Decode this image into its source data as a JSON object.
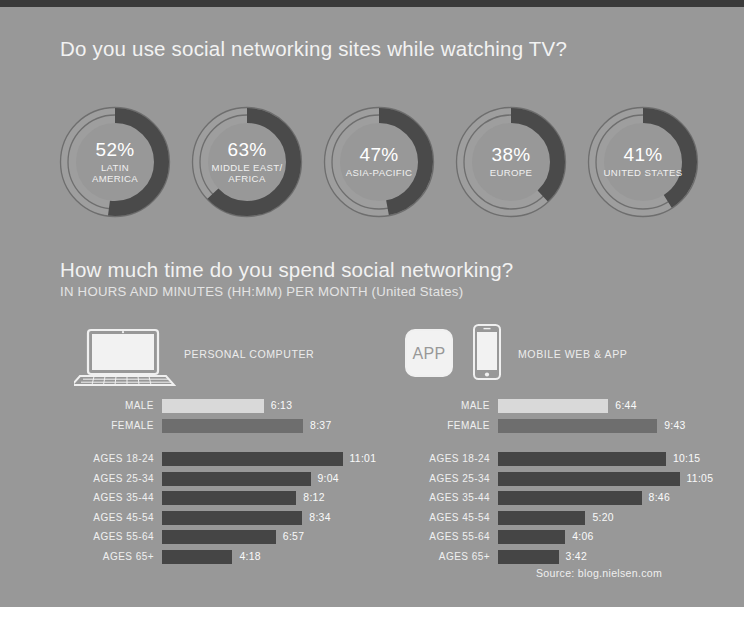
{
  "colors": {
    "background": "#989898",
    "top_band": "#3a3a3a",
    "bottom_band": "#ffffff",
    "donut_track": "#9e9e9e",
    "donut_value": "#4a4a4a",
    "donut_outline": "#6e6e6e",
    "bar_light": "#d9d9d9",
    "bar_medium": "#6e6e6e",
    "bar_dark": "#454545",
    "heading_text": "#f2f2f2"
  },
  "headings": {
    "question1": "Do you use social networking sites while watching TV?",
    "question2": "How much time do you spend social networking?",
    "subtitle2": "IN HOURS AND MINUTES (HH:MM) PER MONTH (United States)"
  },
  "source": "Source: blog.nielsen.com",
  "chart_data": [
    {
      "type": "pie",
      "title": "Do you use social networking sites while watching TV?",
      "unit": "percent",
      "categories": [
        "LATIN\nAMERICA",
        "MIDDLE EAST/\nAFRICA",
        "ASIA-PACIFIC",
        "EUROPE",
        "UNITED STATES"
      ],
      "values": [
        52,
        63,
        47,
        38,
        41
      ],
      "labels": [
        "52%",
        "63%",
        "47%",
        "38%",
        "41%"
      ],
      "legend": "none"
    },
    {
      "type": "bar",
      "orientation": "horizontal",
      "title": "PERSONAL COMPUTER",
      "xlabel": "HOURS:MINUTES PER MONTH",
      "ylabel": "",
      "xlim": [
        0,
        11.6
      ],
      "grid": false,
      "legend": "none",
      "groups": [
        {
          "name": "gender",
          "categories": [
            "MALE",
            "FEMALE"
          ],
          "labels": [
            "6:13",
            "8:37"
          ],
          "values": [
            6.217,
            8.617
          ]
        },
        {
          "name": "age",
          "categories": [
            "AGES 18-24",
            "AGES 25-34",
            "AGES 35-44",
            "AGES 45-54",
            "AGES 55-64",
            "AGES 65+"
          ],
          "labels": [
            "11:01",
            "9:04",
            "8:12",
            "8:34",
            "6:57",
            "4:18"
          ],
          "values": [
            11.017,
            9.067,
            8.2,
            8.567,
            6.95,
            4.3
          ]
        }
      ]
    },
    {
      "type": "bar",
      "orientation": "horizontal",
      "title": "MOBILE WEB & APP",
      "xlabel": "HOURS:MINUTES PER MONTH",
      "ylabel": "",
      "xlim": [
        0,
        11.6
      ],
      "grid": false,
      "legend": "none",
      "groups": [
        {
          "name": "gender",
          "categories": [
            "MALE",
            "FEMALE"
          ],
          "labels": [
            "6:44",
            "9:43"
          ],
          "values": [
            6.733,
            9.717
          ]
        },
        {
          "name": "age",
          "categories": [
            "AGES 18-24",
            "AGES 25-34",
            "AGES 35-44",
            "AGES 45-54",
            "AGES 55-64",
            "AGES 65+"
          ],
          "labels": [
            "10:15",
            "11:05",
            "8:46",
            "5:20",
            "4:06",
            "3:42"
          ],
          "values": [
            10.25,
            11.083,
            8.767,
            5.333,
            4.1,
            3.7
          ]
        }
      ]
    }
  ],
  "donuts": [
    {
      "pct": "52%",
      "region": "LATIN\nAMERICA",
      "value": 52
    },
    {
      "pct": "63%",
      "region": "MIDDLE EAST/\nAFRICA",
      "value": 63
    },
    {
      "pct": "47%",
      "region": "ASIA-PACIFIC",
      "value": 47
    },
    {
      "pct": "38%",
      "region": "EUROPE",
      "value": 38
    },
    {
      "pct": "41%",
      "region": "UNITED STATES",
      "value": 41
    }
  ],
  "panels": [
    {
      "id": "pc",
      "icon_label": "PERSONAL COMPUTER",
      "icons": [
        "laptop-icon"
      ],
      "gender": [
        {
          "label": "MALE",
          "value": "6:13",
          "num": 6.217,
          "tone": "light"
        },
        {
          "label": "FEMALE",
          "value": "8:37",
          "num": 8.617,
          "tone": "medium"
        }
      ],
      "ages": [
        {
          "label": "AGES 18-24",
          "value": "11:01",
          "num": 11.017
        },
        {
          "label": "AGES 25-34",
          "value": "9:04",
          "num": 9.067
        },
        {
          "label": "AGES 35-44",
          "value": "8:12",
          "num": 8.2
        },
        {
          "label": "AGES 45-54",
          "value": "8:34",
          "num": 8.567
        },
        {
          "label": "AGES 55-64",
          "value": "6:57",
          "num": 6.95
        },
        {
          "label": "AGES 65+",
          "value": "4:18",
          "num": 4.3
        }
      ]
    },
    {
      "id": "mobile",
      "icon_label": "MOBILE WEB & APP",
      "icons": [
        "app-icon",
        "phone-icon"
      ],
      "app_icon_text": "APP",
      "gender": [
        {
          "label": "MALE",
          "value": "6:44",
          "num": 6.733,
          "tone": "light"
        },
        {
          "label": "FEMALE",
          "value": "9:43",
          "num": 9.717,
          "tone": "medium"
        }
      ],
      "ages": [
        {
          "label": "AGES 18-24",
          "value": "10:15",
          "num": 10.25
        },
        {
          "label": "AGES 25-34",
          "value": "11:05",
          "num": 11.083
        },
        {
          "label": "AGES 35-44",
          "value": "8:46",
          "num": 8.767
        },
        {
          "label": "AGES 45-54",
          "value": "5:20",
          "num": 5.333
        },
        {
          "label": "AGES 55-64",
          "value": "4:06",
          "num": 4.1
        },
        {
          "label": "AGES 65+",
          "value": "3:42",
          "num": 3.7
        }
      ]
    }
  ]
}
